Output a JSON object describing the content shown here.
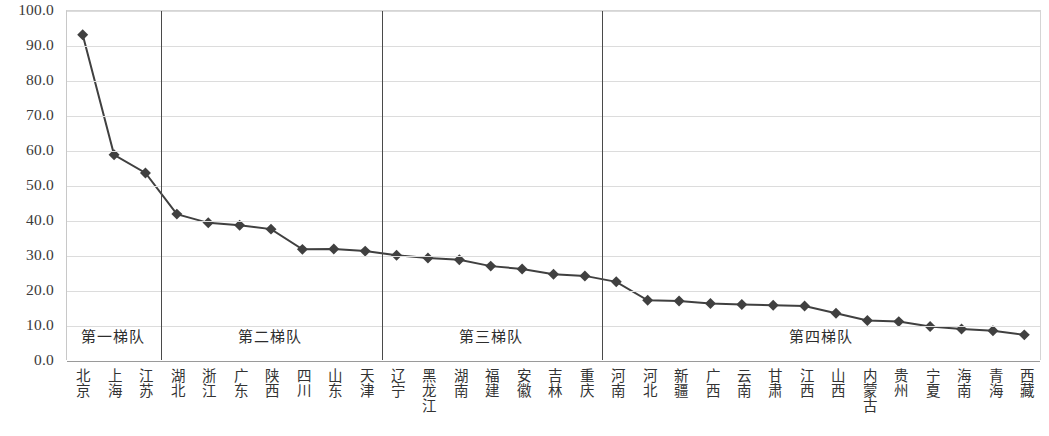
{
  "chart_data": {
    "type": "line",
    "title": "",
    "subtitle": "",
    "xlabel": "",
    "ylabel": "",
    "ylim": [
      0.0,
      100.0
    ],
    "ytick_step": 10.0,
    "grid": true,
    "legend": false,
    "marker": "diamond",
    "series_color": "#404040",
    "categories": [
      "北京",
      "上海",
      "江苏",
      "湖北",
      "浙江",
      "广东",
      "陕西",
      "四川",
      "山东",
      "天津",
      "辽宁",
      "黑龙江",
      "湖南",
      "福建",
      "安徽",
      "吉林",
      "重庆",
      "河南",
      "河北",
      "新疆",
      "广西",
      "云南",
      "甘肃",
      "江西",
      "山西",
      "内蒙古",
      "贵州",
      "宁夏",
      "海南",
      "青海",
      "西藏"
    ],
    "values": [
      93.2,
      58.8,
      53.6,
      41.8,
      39.3,
      38.6,
      37.5,
      31.7,
      31.8,
      31.2,
      30.0,
      29.2,
      28.7,
      26.9,
      26.1,
      24.6,
      24.1,
      22.4,
      17.1,
      16.9,
      16.2,
      15.9,
      15.7,
      15.5,
      13.4,
      11.3,
      11.0,
      9.6,
      8.9,
      8.4,
      7.2
    ],
    "ytick_labels": [
      "100.0",
      "90.0",
      "80.0",
      "70.0",
      "60.0",
      "50.0",
      "40.0",
      "30.0",
      "20.0",
      "10.0",
      "0.0"
    ],
    "ytick_values": [
      100,
      90,
      80,
      70,
      60,
      50,
      40,
      30,
      20,
      10,
      0
    ],
    "tiers": [
      {
        "label": "第一梯队",
        "start_index": 0,
        "end_index": 2
      },
      {
        "label": "第二梯队",
        "start_index": 3,
        "end_index": 9
      },
      {
        "label": "第三梯队",
        "start_index": 10,
        "end_index": 16
      },
      {
        "label": "第四梯队",
        "start_index": 17,
        "end_index": 30
      }
    ],
    "tier_divider_after_index": [
      2,
      9,
      16
    ]
  }
}
